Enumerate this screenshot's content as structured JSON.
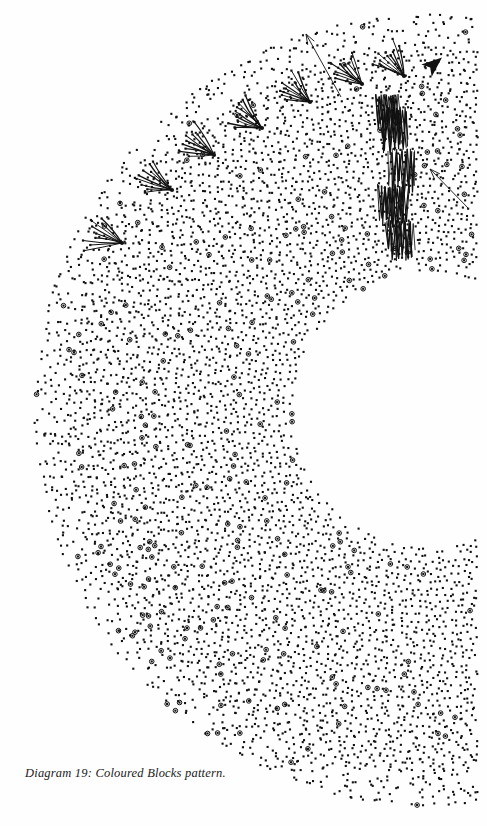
{
  "figure": {
    "caption": "Diagram 19: Coloured Blocks pattern.",
    "caption_style": "italic-serif",
    "background_color": "#fefefe",
    "ink_color": "#111111",
    "width": 487,
    "height": 826
  },
  "chart_data": {
    "type": "scatter",
    "title": "Diagram 19: Coloured Blocks pattern.",
    "subtitle": "",
    "xlabel": "",
    "ylabel": "",
    "coordinate_system": "polar",
    "grid": false,
    "legend": false,
    "legend_position": "none",
    "polar_geometry": {
      "center_x": 430,
      "center_y": 410,
      "r_inner": 140,
      "r_outer": 400,
      "theta_start_deg": 58,
      "theta_end_deg": 302,
      "n_rings": 40,
      "n_spokes": 86,
      "ring_spacing": 6.5,
      "angular_jitter_deg": 0.9,
      "radial_jitter": 2.2
    },
    "marker": {
      "shape": "square",
      "size_px": 2.1,
      "color": "#111111"
    },
    "ring_marker": {
      "shape": "open-circle",
      "diameter_px": 4.6,
      "stroke_px": 1.0,
      "color": "#111111",
      "fraction": 0.022,
      "note": "Scattered highlighted nodes drawn as small open rings around a dot, concentrated along a diagonal band through the pattern."
    },
    "annotations": [
      {
        "name": "fan-burst",
        "type": "radiating-lines",
        "count": 7,
        "rays_per_fan": 9,
        "ray_length_px": 34,
        "spread_deg": 62,
        "tip_dot": true,
        "anchors": [
          {
            "x": 122,
            "y": 243,
            "dir_deg": 200
          },
          {
            "x": 172,
            "y": 190,
            "dir_deg": 205
          },
          {
            "x": 214,
            "y": 155,
            "dir_deg": 208
          },
          {
            "x": 262,
            "y": 128,
            "dir_deg": 212
          },
          {
            "x": 310,
            "y": 102,
            "dir_deg": 216
          },
          {
            "x": 362,
            "y": 84,
            "dir_deg": 222
          },
          {
            "x": 404,
            "y": 76,
            "dir_deg": 230
          }
        ]
      },
      {
        "name": "zigzag-scribble",
        "type": "zigzag-cluster",
        "count": 5,
        "clusters": [
          {
            "x": 392,
            "y": 130,
            "w": 26,
            "h": 40,
            "teeth": 11
          },
          {
            "x": 400,
            "y": 170,
            "w": 24,
            "h": 38,
            "teeth": 10
          },
          {
            "x": 392,
            "y": 205,
            "w": 28,
            "h": 36,
            "teeth": 12
          },
          {
            "x": 398,
            "y": 238,
            "w": 26,
            "h": 34,
            "teeth": 11
          },
          {
            "x": 386,
            "y": 112,
            "w": 22,
            "h": 30,
            "teeth": 9
          }
        ]
      },
      {
        "name": "arrow-upper-left",
        "type": "line-arrow",
        "head": "open",
        "from_x": 341,
        "from_y": 97,
        "to_x": 306,
        "to_y": 34
      },
      {
        "name": "arrow-right",
        "type": "line-arrow",
        "head": "open",
        "from_x": 469,
        "from_y": 209,
        "to_x": 430,
        "to_y": 169
      },
      {
        "name": "arrowhead-solid",
        "type": "filled-triangle",
        "x": 432,
        "y": 66,
        "dir_deg": -40,
        "size_px": 13
      }
    ]
  }
}
